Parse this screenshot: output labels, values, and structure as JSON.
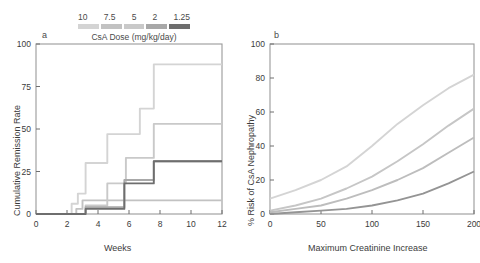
{
  "legend": {
    "title": "CsA Dose (mg/kg/day)",
    "entries": [
      {
        "label": "10",
        "color": "#d4d4d4"
      },
      {
        "label": "7.5",
        "color": "#c2c2c2"
      },
      {
        "label": "5",
        "color": "#c9c9c9"
      },
      {
        "label": "2",
        "color": "#a8a8a8"
      },
      {
        "label": "1.25",
        "color": "#6e6e6e"
      }
    ]
  },
  "chart_data": [
    {
      "type": "line",
      "panel": "a",
      "panel_label": "a",
      "title": "",
      "xlabel": "Weeks",
      "ylabel": "Cumulative Remission Rate",
      "xlim": [
        0,
        12
      ],
      "ylim": [
        0,
        100
      ],
      "xticks": [
        0,
        2,
        4,
        6,
        8,
        10,
        12
      ],
      "yticks": [
        0,
        25,
        50,
        75,
        100
      ],
      "grid": false,
      "legend_position": "top",
      "step": true,
      "series": [
        {
          "name": "10",
          "color": "#d4d4d4",
          "x": [
            0,
            1.7,
            2.3,
            2.7,
            3.2,
            4.6,
            5.8,
            6.7,
            7.6,
            12
          ],
          "y": [
            0,
            0,
            6,
            12,
            30,
            47,
            47,
            62,
            88,
            88
          ]
        },
        {
          "name": "7.5",
          "color": "#c2c2c2",
          "x": [
            0,
            2.2,
            2.6,
            3.0,
            12
          ],
          "y": [
            0,
            0,
            3,
            8,
            8
          ]
        },
        {
          "name": "5",
          "color": "#c9c9c9",
          "x": [
            0,
            2.6,
            3.2,
            4.6,
            5.8,
            7.6,
            12
          ],
          "y": [
            0,
            0,
            5,
            18,
            33,
            53,
            53
          ]
        },
        {
          "name": "2",
          "color": "#a8a8a8",
          "x": [
            0,
            2.9,
            3.2,
            5.7,
            7.6,
            12
          ],
          "y": [
            0,
            0,
            4,
            20,
            31,
            31
          ]
        },
        {
          "name": "1.25",
          "color": "#6e6e6e",
          "x": [
            0,
            2.9,
            3.2,
            5.7,
            7.6,
            12
          ],
          "y": [
            0,
            0,
            3,
            18,
            31,
            31
          ]
        }
      ]
    },
    {
      "type": "line",
      "panel": "b",
      "panel_label": "b",
      "title": "",
      "xlabel": "Maximum Creatinine Increase",
      "ylabel": "% Risk of CsA Nephropathy",
      "xlim": [
        0,
        200
      ],
      "ylim": [
        0,
        100
      ],
      "xticks": [
        0,
        50,
        100,
        150,
        200
      ],
      "yticks": [
        0,
        20,
        40,
        60,
        80,
        100
      ],
      "grid": false,
      "legend_position": "top",
      "step": false,
      "series": [
        {
          "name": "10",
          "color": "#d4d4d4",
          "x": [
            0,
            25,
            50,
            75,
            100,
            125,
            150,
            175,
            200
          ],
          "y": [
            9,
            14,
            20,
            28,
            40,
            53,
            64,
            74,
            82
          ]
        },
        {
          "name": "7.5",
          "color": "#c6c6c6",
          "x": [
            0,
            25,
            50,
            75,
            100,
            125,
            150,
            175,
            200
          ],
          "y": [
            2,
            5,
            9,
            15,
            22,
            31,
            41,
            52,
            62
          ]
        },
        {
          "name": "5",
          "color": "#bdbdbd",
          "x": [
            0,
            25,
            50,
            75,
            100,
            125,
            150,
            175,
            200
          ],
          "y": [
            1,
            3,
            5,
            9,
            14,
            20,
            27,
            36,
            45
          ]
        },
        {
          "name": "2",
          "color": "#949494",
          "x": [
            0,
            25,
            50,
            75,
            100,
            125,
            150,
            175,
            200
          ],
          "y": [
            0,
            1,
            2,
            3,
            5,
            8,
            12,
            18,
            25
          ]
        }
      ]
    }
  ]
}
